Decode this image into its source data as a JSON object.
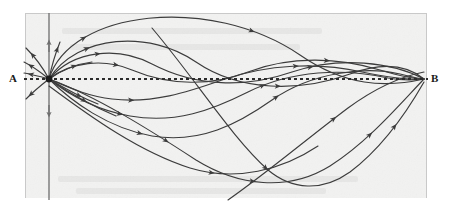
{
  "figure": {
    "kind": "geodesic-family-diagram",
    "caption_points": {
      "start_label": "A",
      "end_label": "B"
    },
    "colors": {
      "paper": "#f2f2f1",
      "outer_margin": "#ffffff",
      "frame_line": "#c9c9c9",
      "curve_ink": "#3c3c3c",
      "axis_ink": "#6e6e6e",
      "dotted_ink": "#2b2b2b",
      "label_ink": "#1a1a1a",
      "node_ink": "#1c1c1c"
    },
    "paper_region": {
      "x": 25,
      "y": 13,
      "width": 402,
      "height": 185
    },
    "frame_edges": {
      "top": {
        "x1": 25,
        "y1": 13,
        "x2": 427,
        "y2": 13
      },
      "left": {
        "x1": 25,
        "y1": 13,
        "x2": 25,
        "y2": 198
      },
      "right": {
        "x1": 427,
        "y1": 13,
        "x2": 427,
        "y2": 198
      }
    },
    "node_A": {
      "x": 49,
      "y": 79,
      "radius": 3.4
    },
    "node_B": {
      "x": 425,
      "y": 79
    },
    "vertical_axis": {
      "x": 49,
      "y_top": 13,
      "y_bottom": 200,
      "arrow_up_at_y": 44,
      "arrow_down_at_y": 114
    },
    "dotted_baseline": {
      "x1": 24,
      "y1": 79,
      "x2": 428,
      "y2": 79,
      "dash_on": 3,
      "dash_off": 3,
      "stroke_width": 2.1
    },
    "curves": [
      {
        "name": "great-arc-upper",
        "note": "largest arc rising to top of frame, descending to B region",
        "d": "M49,79 C70,10 210,-6 300,55 C345,86 385,88 424,79",
        "arrows": [
          {
            "t": 0.13,
            "note": "rising left limb"
          },
          {
            "t": 0.55,
            "note": "descending right limb"
          }
        ]
      },
      {
        "name": "upper-mid-arc",
        "d": "M49,79 C78,34 150,30 196,62 C240,92 300,92 350,74 C385,61 408,66 424,79",
        "arrows": [
          {
            "t": 0.12
          },
          {
            "t": 0.62
          }
        ]
      },
      {
        "name": "upper-shallow-arc",
        "d": "M49,79 C74,50 118,46 152,64 C196,87 246,88 292,72 C340,56 392,62 424,79",
        "arrows": [
          {
            "t": 0.14
          },
          {
            "t": 0.7
          }
        ]
      },
      {
        "name": "near-axis-wave-upper",
        "d": "M49,79 C70,62 104,58 132,70 C170,86 212,86 248,72 C292,55 340,58 380,70 C400,76 414,79 424,79",
        "arrows": [
          {
            "t": 0.18
          },
          {
            "t": 0.74
          }
        ]
      },
      {
        "name": "near-axis-wave-lower",
        "d": "M49,79 C66,86 86,96 112,99 C152,104 188,92 222,80 C268,64 318,62 362,72 C392,78 412,80 424,79",
        "arrows": [
          {
            "t": 0.22
          },
          {
            "t": 0.66
          }
        ]
      },
      {
        "name": "lower-shallow-arc",
        "d": "M49,79 C68,94 96,110 130,116 C176,124 212,110 248,92 C292,70 344,68 388,78 C404,81 416,80 424,79",
        "arrows": [
          {
            "t": 0.2
          },
          {
            "t": 0.58
          }
        ]
      },
      {
        "name": "lower-mid-arc",
        "d": "M49,79 C72,102 108,128 152,136 C200,144 238,124 272,100 C312,72 366,66 400,74 C412,77 419,79 424,79",
        "arrows": [
          {
            "t": 0.26
          },
          {
            "t": 0.62
          }
        ]
      },
      {
        "name": "deep-descending-arc",
        "d": "M49,79 C96,96 150,130 196,160 C238,186 288,192 330,166 C368,142 400,104 424,79",
        "arrows": [
          {
            "t": 0.3
          },
          {
            "t": 0.52
          },
          {
            "t": 0.82
          }
        ]
      },
      {
        "name": "deepest-valley-arc",
        "d": "M152,28 C196,80 232,138 268,170 C292,190 322,192 350,172 C382,148 408,110 424,82",
        "arrows": [
          {
            "t": 0.46
          },
          {
            "t": 0.86
          }
        ]
      },
      {
        "name": "crossing-diagonal-rising",
        "d": "M228,200 C268,172 308,138 348,108 C378,86 404,76 424,72",
        "arrows": [
          {
            "t": 0.56
          }
        ]
      },
      {
        "name": "long-low-sweep",
        "d": "M49,86 C92,118 140,152 190,168 C236,182 282,170 318,146",
        "arrows": [
          {
            "t": 0.62
          }
        ]
      },
      {
        "name": "ray-up-steep-left",
        "d": "M49,79 C42,66 34,56 26,48",
        "arrows": [
          {
            "t": 0.72
          }
        ]
      },
      {
        "name": "ray-up-left",
        "d": "M49,79 C38,70 30,65 24,62",
        "arrows": [
          {
            "t": 0.7
          }
        ]
      },
      {
        "name": "ray-left-flat",
        "d": "M49,79 C38,76 30,74 24,73",
        "arrows": [
          {
            "t": 0.68
          }
        ]
      },
      {
        "name": "ray-down-left",
        "d": "M49,79 C40,86 32,93 26,99",
        "arrows": [
          {
            "t": 0.74
          }
        ]
      },
      {
        "name": "ray-up-near-axis",
        "d": "M49,79 C52,64 56,52 60,42",
        "arrows": [
          {
            "t": 0.76
          }
        ]
      },
      {
        "name": "short-ray-right-up",
        "d": "M49,79 C62,70 76,64 92,62",
        "arrows": [
          {
            "t": 0.58
          }
        ]
      },
      {
        "name": "short-ray-right-down",
        "d": "M49,79 C64,88 80,97 98,104",
        "arrows": [
          {
            "t": 0.6
          }
        ]
      },
      {
        "name": "short-ray-right-down-2",
        "d": "M49,79 C68,92 92,106 116,116",
        "arrows": [
          {
            "t": 0.52
          }
        ]
      }
    ],
    "bleedthrough_text_hint": {
      "visible": true,
      "note": "faint mirrored text from reverse page at bottom margin"
    }
  }
}
